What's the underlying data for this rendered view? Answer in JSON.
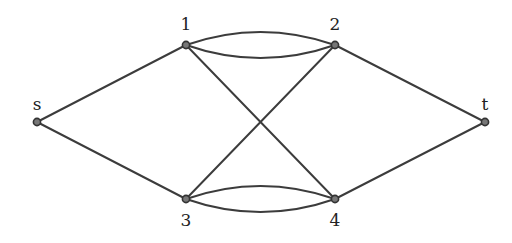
{
  "diagram": {
    "type": "graph",
    "nodes": [
      {
        "id": "s",
        "label": "s",
        "x": 37,
        "y": 122,
        "lx": 37,
        "ly": 110
      },
      {
        "id": "1",
        "label": "1",
        "x": 186,
        "y": 45,
        "lx": 186,
        "ly": 30
      },
      {
        "id": "2",
        "label": "2",
        "x": 335,
        "y": 45,
        "lx": 335,
        "ly": 30
      },
      {
        "id": "3",
        "label": "3",
        "x": 186,
        "y": 199,
        "lx": 186,
        "ly": 226
      },
      {
        "id": "4",
        "label": "4",
        "x": 335,
        "y": 199,
        "lx": 335,
        "ly": 226
      },
      {
        "id": "t",
        "label": "t",
        "x": 485,
        "y": 122,
        "lx": 485,
        "ly": 110
      }
    ],
    "edges": [
      {
        "from": "s",
        "to": "1",
        "curve": 0
      },
      {
        "from": "s",
        "to": "3",
        "curve": 0
      },
      {
        "from": "1",
        "to": "2",
        "curve": -13
      },
      {
        "from": "1",
        "to": "2",
        "curve": 13
      },
      {
        "from": "1",
        "to": "4",
        "curve": 0
      },
      {
        "from": "3",
        "to": "2",
        "curve": 0
      },
      {
        "from": "3",
        "to": "4",
        "curve": -13
      },
      {
        "from": "3",
        "to": "4",
        "curve": 13
      },
      {
        "from": "2",
        "to": "t",
        "curve": 0
      },
      {
        "from": "4",
        "to": "t",
        "curve": 0
      }
    ]
  }
}
